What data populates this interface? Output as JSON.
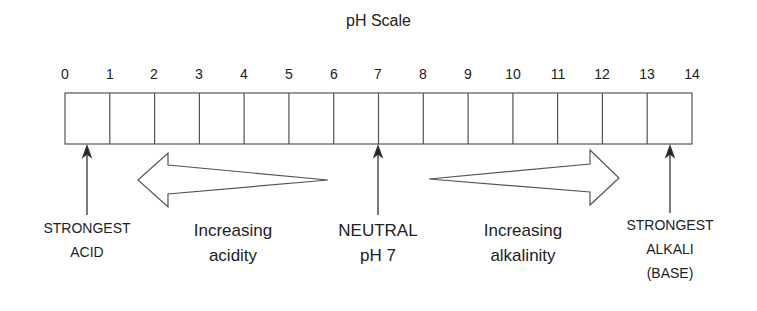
{
  "title": "pH Scale",
  "scale": {
    "min": 0,
    "max": 14,
    "ticks": [
      "0",
      "1",
      "2",
      "3",
      "4",
      "5",
      "6",
      "7",
      "8",
      "9",
      "10",
      "11",
      "12",
      "13",
      "14"
    ]
  },
  "markers": [
    {
      "id": "strongest-acid",
      "position": 0.5,
      "lines": [
        "STRONGEST",
        "ACID"
      ]
    },
    {
      "id": "neutral",
      "position": 7,
      "lines": [
        "NEUTRAL",
        "pH 7"
      ]
    },
    {
      "id": "strongest-alkali",
      "position": 13.5,
      "lines": [
        "STRONGEST",
        "ALKALI",
        "(BASE)"
      ]
    }
  ],
  "trends": [
    {
      "id": "acidity",
      "direction": "left",
      "lines": [
        "Increasing",
        "acidity"
      ]
    },
    {
      "id": "alkalinity",
      "direction": "right",
      "lines": [
        "Increasing",
        "alkalinity"
      ]
    }
  ],
  "colors": {
    "stroke": "#555555",
    "text": "#222222",
    "background": "#ffffff"
  }
}
